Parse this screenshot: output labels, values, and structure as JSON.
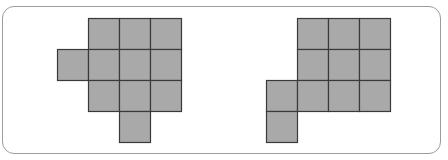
{
  "diagram": {
    "colors": {
      "cell_fill": "#a9a9a9",
      "cell_stroke": "#3a3a3a",
      "frame_stroke": "#9c9c9c",
      "background": "#ffffff"
    },
    "cell_size": 31,
    "figures": [
      {
        "name": "left-figure",
        "origin": [
          57,
          18
        ],
        "cell_count": 11,
        "cells": [
          [
            0,
            1
          ],
          [
            0,
            2
          ],
          [
            0,
            3
          ],
          [
            1,
            0
          ],
          [
            1,
            1
          ],
          [
            1,
            2
          ],
          [
            1,
            3
          ],
          [
            2,
            1
          ],
          [
            2,
            2
          ],
          [
            2,
            3
          ],
          [
            3,
            2
          ]
        ]
      },
      {
        "name": "right-figure",
        "origin": [
          266,
          18
        ],
        "cell_count": 11,
        "cells": [
          [
            0,
            1
          ],
          [
            0,
            2
          ],
          [
            0,
            3
          ],
          [
            1,
            1
          ],
          [
            1,
            2
          ],
          [
            1,
            3
          ],
          [
            2,
            0
          ],
          [
            2,
            1
          ],
          [
            2,
            2
          ],
          [
            2,
            3
          ],
          [
            3,
            0
          ]
        ]
      }
    ]
  }
}
